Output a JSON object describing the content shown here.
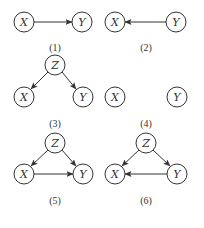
{
  "panels": [
    {
      "label": "(1)",
      "nodes": [
        "X",
        "Y"
      ],
      "edges": [
        [
          "X",
          "Y"
        ]
      ]
    },
    {
      "label": "(2)",
      "nodes": [
        "X",
        "Y"
      ],
      "edges": [
        [
          "Y",
          "X"
        ]
      ]
    },
    {
      "label": "(3)",
      "nodes": [
        "Z",
        "X",
        "Y"
      ],
      "edges": [
        [
          "Z",
          "X"
        ],
        [
          "Z",
          "Y"
        ]
      ]
    },
    {
      "label": "(4)",
      "nodes": [
        "X",
        "Y"
      ],
      "edges": []
    },
    {
      "label": "(5)",
      "nodes": [
        "Z",
        "X",
        "Y"
      ],
      "edges": [
        [
          "Z",
          "X"
        ],
        [
          "Z",
          "Y"
        ],
        [
          "X",
          "Y"
        ]
      ]
    },
    {
      "label": "(6)",
      "nodes": [
        "Z",
        "X",
        "Y"
      ],
      "edges": [
        [
          "Z",
          "X"
        ],
        [
          "Z",
          "Y"
        ],
        [
          "Y",
          "X"
        ]
      ]
    }
  ],
  "colors": {
    "stroke": "#333333",
    "background": "#ffffff"
  }
}
